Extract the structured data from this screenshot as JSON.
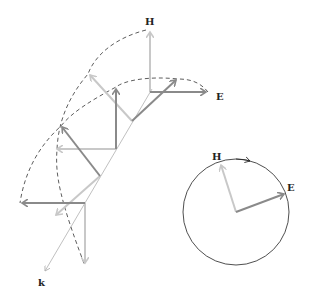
{
  "labels": {
    "H_wave": "H",
    "E_wave": "E",
    "k_axis": "k",
    "H_circle": "H",
    "E_circle": "E"
  },
  "colors": {
    "E_vector": "#8a8a8a",
    "H_vector": "#c8c8c8",
    "axis": "#b0b0b0",
    "dashed_envelope": "#333333",
    "circle": "#222222"
  },
  "wave_points": [
    {
      "origin": [
        150,
        92
      ],
      "E_tip": [
        208,
        92
      ],
      "H_tip": [
        150,
        30
      ]
    },
    {
      "origin": [
        132,
        121
      ],
      "E_tip": [
        178,
        79
      ],
      "H_tip": [
        89,
        74
      ]
    },
    {
      "origin": [
        116,
        149
      ],
      "E_tip": [
        116,
        87
      ],
      "H_tip": [
        55,
        149
      ]
    },
    {
      "origin": [
        100,
        176
      ],
      "E_tip": [
        61,
        126
      ],
      "H_tip": [
        55,
        216
      ]
    },
    {
      "origin": [
        85,
        203
      ],
      "E_tip": [
        20,
        203
      ],
      "H_tip": [
        85,
        265
      ]
    }
  ],
  "circle": {
    "center": [
      236,
      212
    ],
    "radius": 53,
    "E_tip": [
      286,
      193
    ],
    "H_tip": [
      220,
      163
    ]
  }
}
